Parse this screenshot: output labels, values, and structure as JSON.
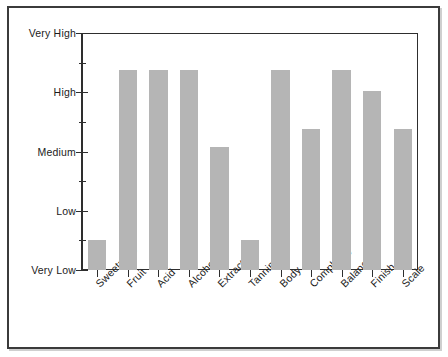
{
  "chart_data": {
    "type": "bar",
    "title": "",
    "subtitle": "",
    "xlabel": "",
    "ylabel": "",
    "categories": [
      "Sweetness",
      "Fruit",
      "Acid",
      "Alcohol",
      "Extract",
      "Tannin",
      "Body",
      "Complexity",
      "Balance",
      "Finish",
      "Scale"
    ],
    "values": [
      1,
      6.75,
      6.75,
      6.75,
      4.15,
      1,
      6.75,
      4.75,
      6.75,
      6.05,
      4.75
    ],
    "y_tick_labels": [
      "Very Low",
      "Low",
      "Medium",
      "High",
      "Very High"
    ],
    "y_tick_values": [
      0,
      2,
      4,
      6,
      8
    ],
    "y_minor_tick_values": [
      1,
      3,
      5,
      7
    ],
    "ylim": [
      0,
      8
    ],
    "value_scale_note": "ordinal scale: 0=Very Low, 2=Low, 4=Medium, 6=High, 8=Very High",
    "grid": false,
    "legend": null,
    "legend_position": "none",
    "bar_color": "#b5b5b5",
    "axis_color": "#2e2e2e",
    "frame_color": "#3b3b3b",
    "background_color": "#ffffff",
    "xtick_label_rotation": -45
  }
}
